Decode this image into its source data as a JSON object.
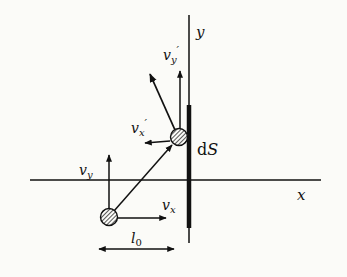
{
  "diagram": {
    "type": "physics-collision-diagram",
    "axes": {
      "x_label": "x",
      "y_label": "y"
    },
    "surface_label": {
      "prefix": "d",
      "var": "S"
    },
    "particle_before": {
      "velocity_components": {
        "vx": {
          "base": "v",
          "sub": "x"
        },
        "vy": {
          "base": "v",
          "sub": "y"
        }
      }
    },
    "particle_after": {
      "velocity_components": {
        "vx": {
          "base": "v",
          "sub": "x",
          "prime": "′"
        },
        "vy": {
          "base": "v",
          "sub": "y",
          "prime": "′"
        }
      }
    },
    "distance_label": {
      "base": "l",
      "sub": "0"
    },
    "colors": {
      "ink": "#111111",
      "background": "#fbfbf8"
    }
  }
}
